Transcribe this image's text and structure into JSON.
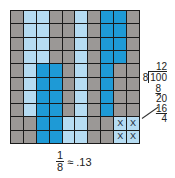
{
  "grid": {
    "rows": 10,
    "cols": 10,
    "colors": {
      "gray": "#9b9896",
      "light_blue": "#b6dcf2",
      "blue": "#1e9ad6"
    },
    "cells": [
      [
        "g",
        "l",
        "l",
        "g",
        "g",
        "l",
        "g",
        "b",
        "b",
        "g"
      ],
      [
        "g",
        "l",
        "l",
        "g",
        "g",
        "l",
        "g",
        "b",
        "b",
        "g"
      ],
      [
        "g",
        "l",
        "l",
        "g",
        "g",
        "l",
        "g",
        "b",
        "b",
        "g"
      ],
      [
        "g",
        "l",
        "l",
        "g",
        "g",
        "l",
        "g",
        "b",
        "b",
        "g"
      ],
      [
        "g",
        "l",
        "b",
        "b",
        "g",
        "l",
        "g",
        "b",
        "g",
        "g"
      ],
      [
        "g",
        "l",
        "b",
        "b",
        "g",
        "l",
        "g",
        "b",
        "g",
        "g"
      ],
      [
        "g",
        "l",
        "b",
        "b",
        "g",
        "l",
        "g",
        "b",
        "g",
        "g"
      ],
      [
        "g",
        "l",
        "b",
        "b",
        "g",
        "l",
        "g",
        "b",
        "g",
        "g"
      ],
      [
        "g",
        "g",
        "b",
        "b",
        "l",
        "l",
        "g",
        "g",
        "lx",
        "lx"
      ],
      [
        "g",
        "g",
        "b",
        "b",
        "l",
        "l",
        "g",
        "g",
        "lx",
        "lx"
      ]
    ],
    "mark": "X"
  },
  "long_division": {
    "quotient": "12",
    "divisor": "8",
    "dividend": "100",
    "step1": "8",
    "remainder1": "20",
    "step2": "16",
    "remainder2": "4"
  },
  "caption": {
    "numerator": "1",
    "denominator": "8",
    "approx": "≈ .13"
  }
}
